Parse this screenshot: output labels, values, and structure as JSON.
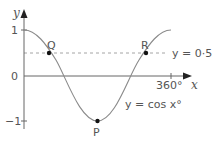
{
  "diagram": {
    "axes": {
      "x_label": "x",
      "y_label": "y",
      "y_ticks": [
        {
          "label": "1",
          "value": 1
        },
        {
          "label": "0",
          "value": 0
        },
        {
          "label": "−1",
          "value": -1
        }
      ],
      "x_ticks": [
        {
          "label": "360°",
          "value": 360
        }
      ]
    },
    "curve": {
      "label": "y = cos x°",
      "function": "cos",
      "domain": [
        0,
        360
      ],
      "color": "#8a8a8a"
    },
    "reference_line": {
      "label": "y = 0·5",
      "value": 0.5,
      "style": "dashed"
    },
    "points": [
      {
        "label": "Q",
        "x": 60,
        "y": 0.5
      },
      {
        "label": "R",
        "x": 300,
        "y": 0.5
      },
      {
        "label": "P",
        "x": 180,
        "y": -1
      }
    ],
    "colors": {
      "axis": "#555555",
      "curve": "#8a8a8a",
      "dashed": "#9a9a9a",
      "point": "#111111",
      "text": "#555555"
    }
  }
}
